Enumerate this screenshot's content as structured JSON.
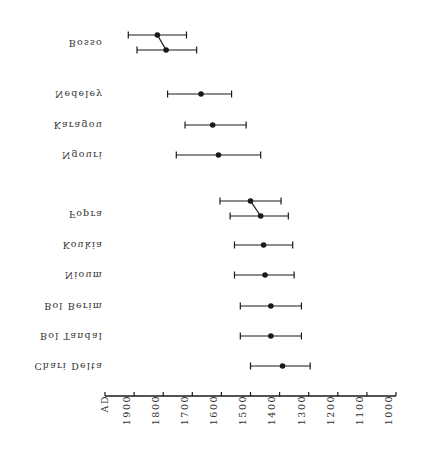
{
  "chart_data": {
    "type": "scatter",
    "subtype": "horizontal-error-bars",
    "title": "",
    "xlabel": "AD",
    "ylabel": "",
    "x_axis": {
      "label": "AD",
      "reversed": true,
      "range": [
        2000,
        1000
      ],
      "ticks": [
        1900,
        1800,
        1700,
        1600,
        1500,
        1400,
        1300,
        1200,
        1100,
        1000
      ],
      "tick_labels": [
        "1900",
        "1800",
        "1700",
        "1600",
        "1500",
        "1400",
        "1300",
        "1200",
        "1100",
        "1000"
      ]
    },
    "grid": false,
    "legend": null,
    "labels_flipped_vertically": true,
    "sites": [
      {
        "name": "Bosso",
        "dates": [
          {
            "mid": 1820,
            "low": 1720,
            "high": 1920
          },
          {
            "mid": 1790,
            "low": 1685,
            "high": 1890
          }
        ],
        "connected": true
      },
      {
        "name": "Nedeley",
        "dates": [
          {
            "mid": 1670,
            "low": 1565,
            "high": 1785
          }
        ]
      },
      {
        "name": "Karagou",
        "dates": [
          {
            "mid": 1630,
            "low": 1515,
            "high": 1725
          }
        ]
      },
      {
        "name": "Ngouri",
        "dates": [
          {
            "mid": 1610,
            "low": 1465,
            "high": 1755
          }
        ]
      },
      {
        "name": "Fopra",
        "dates": [
          {
            "mid": 1500,
            "low": 1395,
            "high": 1605
          },
          {
            "mid": 1465,
            "low": 1370,
            "high": 1570
          }
        ],
        "connected": true
      },
      {
        "name": "Koukia",
        "dates": [
          {
            "mid": 1455,
            "low": 1355,
            "high": 1555
          }
        ]
      },
      {
        "name": "Nioum",
        "dates": [
          {
            "mid": 1450,
            "low": 1350,
            "high": 1555
          }
        ]
      },
      {
        "name": "Bol Berim",
        "dates": [
          {
            "mid": 1430,
            "low": 1325,
            "high": 1535
          }
        ]
      },
      {
        "name": "Bol Tandal",
        "dates": [
          {
            "mid": 1430,
            "low": 1325,
            "high": 1535
          }
        ]
      },
      {
        "name": "Chari Delta",
        "dates": [
          {
            "mid": 1390,
            "low": 1295,
            "high": 1500
          }
        ]
      }
    ]
  },
  "labels": {
    "axis_unit": "AD",
    "sites": [
      "Bosso",
      "Nedeley",
      "Karagou",
      "Ngouri",
      "Fopra",
      "Koukia",
      "Nioum",
      "Bol Berim",
      "Bol Tandal",
      "Chari Delta"
    ],
    "ticks": [
      "1900",
      "1800",
      "1700",
      "1600",
      "1500",
      "1400",
      "1300",
      "1200",
      "1100",
      "1000"
    ]
  },
  "colors": {
    "ink": "#1a1a1a",
    "background": "#ffffff"
  }
}
